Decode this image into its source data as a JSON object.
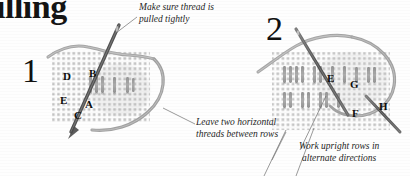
{
  "page": {
    "title_fragment": "illing",
    "background_color": "#fefefe",
    "ink_color": "#1a1a1a"
  },
  "diagram": {
    "kind": "embroidery-stitch-instruction",
    "steps": [
      {
        "number": "1",
        "panel": "left",
        "fabric": {
          "x": 52,
          "y": 50,
          "width": 98,
          "height": 72,
          "color": "#cfcfcf"
        },
        "stitch_labels": [
          {
            "text": "D",
            "x": 63,
            "y": 71
          },
          {
            "text": "B",
            "x": 89,
            "y": 68
          },
          {
            "text": "E",
            "x": 60,
            "y": 95
          },
          {
            "text": "A",
            "x": 85,
            "y": 99
          },
          {
            "text": "C",
            "x": 74,
            "y": 110
          }
        ]
      },
      {
        "number": "2",
        "panel": "right",
        "fabric": {
          "x": 272,
          "y": 52,
          "width": 118,
          "height": 78,
          "color": "#cfcfcf"
        },
        "stitch_labels": [
          {
            "text": "E",
            "x": 327,
            "y": 73
          },
          {
            "text": "G",
            "x": 350,
            "y": 79
          },
          {
            "text": "F",
            "x": 352,
            "y": 108
          },
          {
            "text": "H",
            "x": 379,
            "y": 101
          }
        ]
      }
    ],
    "annotations": [
      {
        "id": "note-top",
        "text": "Make sure thread is\npulled tightly"
      },
      {
        "id": "note-middle",
        "text": "Leave two horizontal\nthreads between rows"
      },
      {
        "id": "note-bottom",
        "text": "Work upright rows in\nalternate directions"
      }
    ],
    "colors": {
      "thread": "#a8a8a8",
      "thread_dark": "#8d8d8d",
      "needle": "#5e5e5e",
      "fabric_weave": "#b9b9b9",
      "stitch": "#9a9a9a",
      "leader_line": "#6f6f6f"
    }
  }
}
